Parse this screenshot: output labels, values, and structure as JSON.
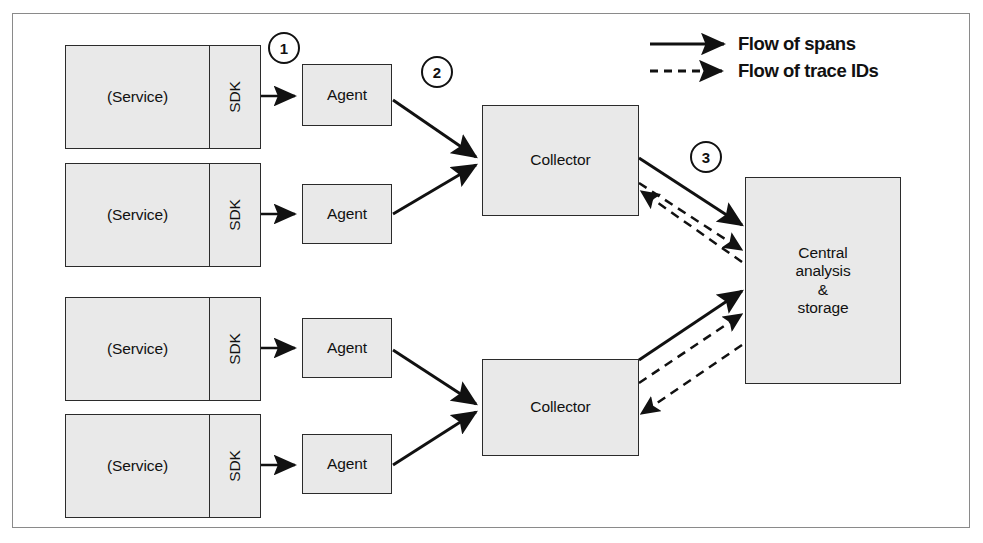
{
  "diagram": {
    "background": "#ffffff",
    "node_fill": "#e9e9e9",
    "stroke": "#2b2b2b",
    "frame_stroke": "#8a8a8a"
  },
  "legend": {
    "items": [
      {
        "label": "Flow of spans",
        "style": "solid",
        "icon": "solid-arrow-icon"
      },
      {
        "label": "Flow of trace IDs",
        "style": "dashed",
        "icon": "dashed-arrow-icon"
      }
    ]
  },
  "steps": [
    {
      "number": "1"
    },
    {
      "number": "2"
    },
    {
      "number": "3"
    }
  ],
  "services": [
    {
      "label": "(Service)",
      "sdk_label": "SDK"
    },
    {
      "label": "(Service)",
      "sdk_label": "SDK"
    },
    {
      "label": "(Service)",
      "sdk_label": "SDK"
    },
    {
      "label": "(Service)",
      "sdk_label": "SDK"
    }
  ],
  "agents": [
    {
      "label": "Agent"
    },
    {
      "label": "Agent"
    },
    {
      "label": "Agent"
    },
    {
      "label": "Agent"
    }
  ],
  "collectors": [
    {
      "label": "Collector"
    },
    {
      "label": "Collector"
    }
  ],
  "central": {
    "label": "Central\nanalysis\n&\nstorage"
  }
}
